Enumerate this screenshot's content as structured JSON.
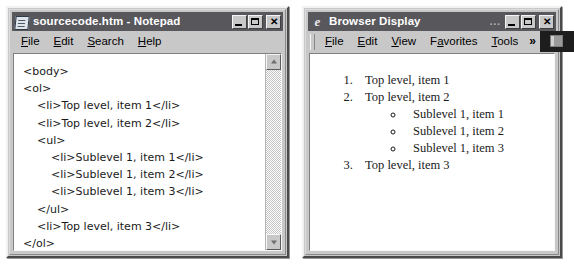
{
  "notepad": {
    "title": "sourcecode.htm - Notepad",
    "icon": "notepad-document-icon",
    "menu": [
      {
        "label": "File",
        "accel": "F"
      },
      {
        "label": "Edit",
        "accel": "E"
      },
      {
        "label": "Search",
        "accel": "S"
      },
      {
        "label": "Help",
        "accel": "H"
      }
    ],
    "window_controls": {
      "minimize": "minimize",
      "maximize": "maximize",
      "close": "close"
    },
    "source_code": "<body>\n<ol>\n    <li>Top level, item 1</li>\n    <li>Top level, item 2</li>\n    <ul>\n        <li>Sublevel 1, item 1</li>\n        <li>Sublevel 1, item 2</li>\n        <li>Sublevel 1, item 3</li>\n    </ul>\n    <li>Top level, item 3</li>\n</ol>\n</body>",
    "scrollbar": {
      "up_arrow": "scroll-up",
      "down_arrow": "scroll-down"
    }
  },
  "browser": {
    "title": "Browser Display",
    "title_overflow": "...",
    "icon": "internet-explorer-icon",
    "menu": [
      {
        "label": "File",
        "accel": "F"
      },
      {
        "label": "Edit",
        "accel": "E"
      },
      {
        "label": "View",
        "accel": "V"
      },
      {
        "label": "Favorites",
        "accel": "a"
      },
      {
        "label": "Tools",
        "accel": "T"
      }
    ],
    "menu_overflow": "»",
    "brand_button": "browser-logo-button",
    "window_controls": {
      "minimize": "minimize",
      "maximize": "maximize",
      "close": "close"
    },
    "rendered_list": [
      {
        "marker": "1.",
        "text": "Top level, item 1",
        "children": []
      },
      {
        "marker": "2.",
        "text": "Top level, item 2",
        "children": [
          {
            "marker": "o",
            "text": "Sublevel 1, item 1"
          },
          {
            "marker": "o",
            "text": "Sublevel 1, item 2"
          },
          {
            "marker": "o",
            "text": "Sublevel 1, item 3"
          }
        ]
      },
      {
        "marker": "3.",
        "text": "Top level, item 3",
        "children": []
      }
    ]
  },
  "colors": {
    "titlebar": "#57575c",
    "window_face": "#c8c8c8",
    "client": "#ffffff",
    "text": "#1a1a1a"
  }
}
